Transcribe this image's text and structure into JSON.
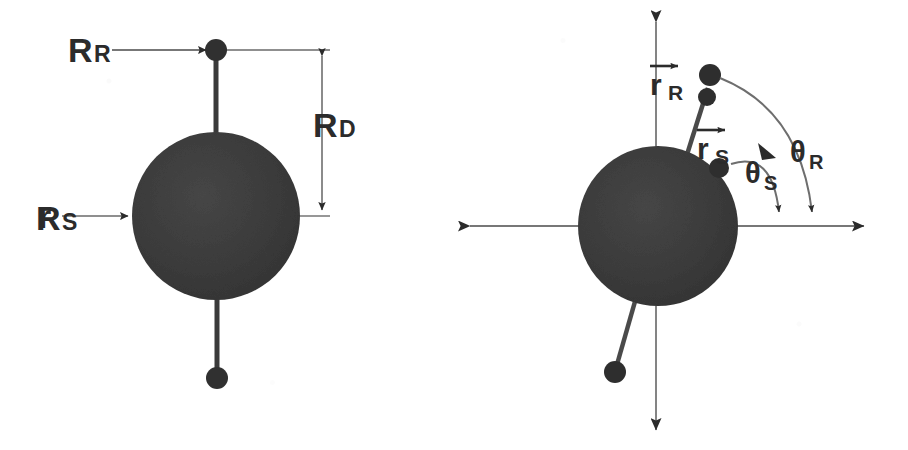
{
  "figure": {
    "caption_present": false,
    "background_color": "#ffffff",
    "ink_color": "#2b2b2b",
    "sphere_fill": "#3a3a3a",
    "panel_count": 2
  },
  "panels": [
    {
      "id": "left-panel",
      "name": "undeflected-rotor-geometry",
      "labels": [
        {
          "key": "R_R",
          "base": "R",
          "subscript": "R",
          "role": "rod-mass-radius-label"
        },
        {
          "key": "R_S",
          "base": "R",
          "subscript": "S",
          "role": "sphere-radius-label"
        },
        {
          "key": "R_D",
          "base": "R",
          "subscript": "D",
          "role": "dumbbell-half-length-label"
        }
      ],
      "sphere": {
        "cx": 216,
        "cy": 216,
        "r": 84
      },
      "top_mass": {
        "cx": 216,
        "cy": 50,
        "r": 11
      },
      "bottom_mass": {
        "cx": 217,
        "cy": 378,
        "r": 11
      },
      "dimension_line": {
        "x": 322,
        "y_top": 50,
        "y_bottom": 216
      }
    },
    {
      "id": "right-panel",
      "name": "deflected-rotor-with-angles",
      "labels": [
        {
          "key": "r_R",
          "base": "r",
          "subscript": "R",
          "vector": true,
          "role": "rod-mass-position-vector"
        },
        {
          "key": "r_S",
          "base": "r",
          "subscript": "S",
          "vector": true,
          "role": "sphere-surface-position-vector"
        },
        {
          "key": "theta_S",
          "base": "θ",
          "subscript": "S",
          "role": "sphere-angle-label"
        },
        {
          "key": "theta_R",
          "base": "θ",
          "subscript": "R",
          "role": "rod-angle-label"
        }
      ],
      "sphere": {
        "cx": 658,
        "cy": 226,
        "r": 80
      },
      "axes": {
        "horizontal": {
          "x_start": 462,
          "x_end": 872,
          "y": 226
        },
        "vertical": {
          "x": 656,
          "y_start": 14,
          "y_end": 438
        }
      },
      "upper_mass": {
        "cx": 710,
        "cy": 75,
        "r": 11
      },
      "upper_inner_mass": {
        "cx": 707,
        "cy": 97,
        "r": 9
      },
      "surface_mass": {
        "cx": 719,
        "cy": 168,
        "r": 10
      },
      "lower_mass": {
        "cx": 615,
        "cy": 372,
        "r": 11
      },
      "angle_arcs": [
        {
          "key": "theta_S",
          "tip_x": 780,
          "tip_y": 218
        },
        {
          "key": "theta_R",
          "tip_x": 812,
          "tip_y": 218
        }
      ]
    }
  ],
  "text": {
    "R": "R",
    "r": "r",
    "theta": "θ",
    "sub_R": "R",
    "sub_S": "S",
    "sub_D": "D"
  }
}
